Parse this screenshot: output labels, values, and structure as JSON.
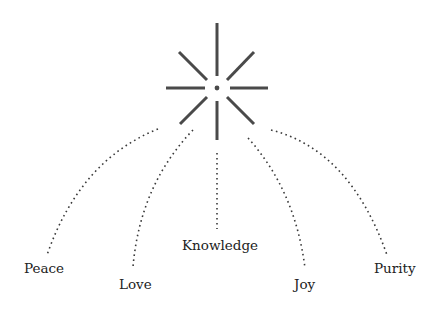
{
  "diagram": {
    "type": "radial-star-with-branches",
    "center": {
      "x": 217,
      "y": 88
    },
    "star_rays": [
      {
        "name": "top",
        "x1": 217,
        "y1": 23,
        "x2": 217,
        "y2": 76
      },
      {
        "name": "bottom",
        "x1": 217,
        "y1": 101,
        "x2": 217,
        "y2": 140
      },
      {
        "name": "left",
        "x1": 166,
        "y1": 88,
        "x2": 205,
        "y2": 88
      },
      {
        "name": "right",
        "x1": 230,
        "y1": 88,
        "x2": 268,
        "y2": 88
      },
      {
        "name": "upper-left",
        "x1": 179,
        "y1": 52,
        "x2": 207,
        "y2": 80
      },
      {
        "name": "upper-right",
        "x1": 254,
        "y1": 52,
        "x2": 227,
        "y2": 80
      },
      {
        "name": "lower-left",
        "x1": 207,
        "y1": 97,
        "x2": 180,
        "y2": 124
      },
      {
        "name": "lower-right",
        "x1": 227,
        "y1": 97,
        "x2": 254,
        "y2": 124
      }
    ],
    "branches": [
      {
        "label": "Peace",
        "path": "M158,129 Q80,160 47,255",
        "label_x": 24,
        "label_y": 273
      },
      {
        "label": "Love",
        "path": "M193,130 Q140,185 133,267",
        "label_x": 119,
        "label_y": 289
      },
      {
        "label": "Knowledge",
        "path": "M217,153 L217,229",
        "label_x": 182,
        "label_y": 250
      },
      {
        "label": "Joy",
        "path": "M248,138 Q295,190 305,268",
        "label_x": 294,
        "label_y": 289
      },
      {
        "label": "Purity",
        "path": "M271,130 Q350,150 387,255",
        "label_x": 374,
        "label_y": 273
      }
    ],
    "labels": {
      "peace": "Peace",
      "love": "Love",
      "knowledge": "Knowledge",
      "joy": "Joy",
      "purity": "Purity"
    },
    "colors": {
      "ray": "#4a4a4a",
      "connector": "#3a3a3a",
      "text": "#222222",
      "background": "#ffffff"
    }
  }
}
